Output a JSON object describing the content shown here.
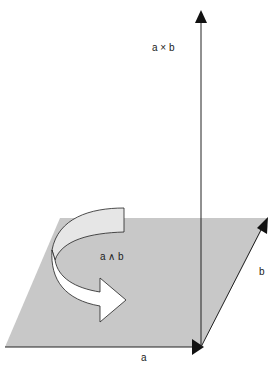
{
  "diagram": {
    "title": "",
    "labels": {
      "cross": "a × b",
      "wedge": "a ∧ b",
      "vec_a": "a",
      "vec_b": "b"
    },
    "colors": {
      "plane": "#c8c8c8",
      "arrow_light": "#e6e6e6",
      "arrow_white": "#ffffff",
      "line": "#222222"
    }
  }
}
